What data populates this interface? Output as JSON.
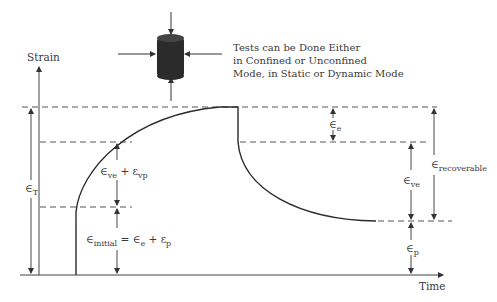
{
  "axes": {
    "y_label": "Strain",
    "x_label": "Time"
  },
  "note": {
    "line1": "Tests can be Done Either",
    "line2": "in Confined or Unconfined",
    "line3": "Mode, in Static or Dynamic Mode"
  },
  "labels": {
    "total": {
      "sym": "∈",
      "sub": "T"
    },
    "ve_vp": {
      "a": "∈",
      "a_sub": "ve",
      "plus": " + ",
      "b": "ε",
      "b_sub": "vp"
    },
    "initial": {
      "a": "∈",
      "a_sub": "initial",
      "eq": " = ",
      "b": "∈",
      "b_sub": "e",
      "plus": " + ",
      "c": "ε",
      "c_sub": "p"
    },
    "elastic": {
      "sym": "∈",
      "sub": "e"
    },
    "viscoelastic": {
      "sym": "∈",
      "sub": "ve"
    },
    "recoverable": {
      "sym": "∈",
      "sub": "recoverable"
    },
    "plastic": {
      "sym": "∈",
      "sub": "p"
    }
  },
  "colors": {
    "line": "#333333",
    "dash": "#555555",
    "specimen": "#2b2b2b"
  }
}
